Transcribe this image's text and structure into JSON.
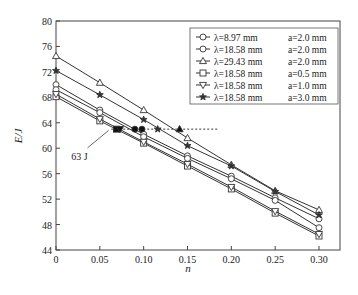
{
  "chart_data": {
    "type": "line",
    "title": "",
    "xlabel": "n",
    "ylabel": "E/J",
    "xlim": [
      0,
      0.32
    ],
    "ylim": [
      44,
      80
    ],
    "xticks": [
      0,
      0.05,
      0.1,
      0.15,
      0.2,
      0.25,
      0.3
    ],
    "xtick_labels": [
      "0",
      "0.05",
      "0.10",
      "0.15",
      "0.20",
      "0.25",
      "0.30"
    ],
    "yticks": [
      44,
      48,
      52,
      56,
      60,
      64,
      68,
      72,
      76,
      80
    ],
    "ytick_labels": [
      "44",
      "48",
      "52",
      "56",
      "60",
      "64",
      "68",
      "72",
      "76",
      "80"
    ],
    "grid": false,
    "legend_position": "upper right",
    "x": [
      0,
      0.05,
      0.1,
      0.15,
      0.2,
      0.25,
      0.3
    ],
    "series": [
      {
        "name": "λ=8.97 mm  a=2.0 mm",
        "lambda": "λ=8.97 mm",
        "a": "a=2.0 mm",
        "marker": "circle",
        "values": [
          70.0,
          66.0,
          62.2,
          58.8,
          55.6,
          52.2,
          48.9
        ]
      },
      {
        "name": "λ=18.58 mm a=2.0 mm",
        "lambda": "λ=18.58 mm",
        "a": "a=2.0 mm",
        "marker": "circle",
        "values": [
          69.2,
          65.6,
          61.8,
          58.4,
          55.2,
          51.8,
          47.5
        ]
      },
      {
        "name": "λ=29.43 mm a=2.0 mm",
        "lambda": "λ=29.43 mm",
        "a": "a=2.0 mm",
        "marker": "triangle-up",
        "values": [
          74.5,
          70.3,
          66.0,
          61.6,
          57.4,
          53.3,
          50.3
        ]
      },
      {
        "name": "λ=18.58 mm a=0.5 mm",
        "lambda": "λ=18.58 mm",
        "a": "a=0.5 mm",
        "marker": "square",
        "values": [
          68.1,
          64.3,
          60.8,
          57.2,
          53.6,
          49.8,
          46.2
        ]
      },
      {
        "name": "λ=18.58 mm a=1.0 mm",
        "lambda": "λ=18.58 mm",
        "a": "a=1.0 mm",
        "marker": "triangle-down",
        "values": [
          68.5,
          64.6,
          61.0,
          57.5,
          53.9,
          50.1,
          46.5
        ]
      },
      {
        "name": "λ=18.58 mm a=3.0 mm",
        "lambda": "λ=18.58 mm",
        "a": "a=3.0 mm",
        "marker": "star",
        "values": [
          72.2,
          68.4,
          64.5,
          60.4,
          57.2,
          53.2,
          49.5
        ]
      }
    ],
    "annotations": [
      {
        "type": "hline-dashed",
        "y": 63,
        "x_from": 0.063,
        "x_to": 0.185
      },
      {
        "type": "label",
        "text": "63 J",
        "x": 0.02,
        "y": 58.8,
        "leader_to": [
          0.06,
          62.8
        ]
      },
      {
        "type": "filled-markers",
        "y": 63,
        "points": [
          {
            "x": 0.069,
            "marker": "square"
          },
          {
            "x": 0.073,
            "marker": "triangle-down"
          },
          {
            "x": 0.09,
            "marker": "circle"
          },
          {
            "x": 0.098,
            "marker": "circle"
          },
          {
            "x": 0.116,
            "marker": "star"
          },
          {
            "x": 0.141,
            "marker": "triangle-up"
          }
        ]
      }
    ]
  }
}
